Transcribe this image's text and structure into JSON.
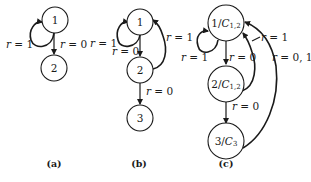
{
  "diagrams": {
    "a": {
      "caption": "(a)",
      "nodes": [
        {
          "id": "1",
          "label": "1"
        },
        {
          "id": "2",
          "label": "2"
        }
      ],
      "edges": [
        {
          "from": "1",
          "to": "1",
          "label": "r = 1",
          "var": "r",
          "eq": " = 1"
        },
        {
          "from": "1",
          "to": "2",
          "label": "r = 0",
          "var": "r",
          "eq": " = 0"
        }
      ]
    },
    "b": {
      "caption": "(b)",
      "nodes": [
        {
          "id": "1",
          "label": "1"
        },
        {
          "id": "2",
          "label": "2"
        },
        {
          "id": "3",
          "label": "3"
        }
      ],
      "edges": [
        {
          "from": "1",
          "to": "1",
          "label": "r = 1",
          "var": "r",
          "eq": " = 1"
        },
        {
          "from": "1",
          "to": "2",
          "label": "r = 0",
          "var": "r",
          "eq": " = 0"
        },
        {
          "from": "2",
          "to": "1",
          "label": "r = 1",
          "var": "r",
          "eq": " = 1"
        },
        {
          "from": "2",
          "to": "3",
          "label": "r = 0",
          "var": "r",
          "eq": " = 0"
        }
      ]
    },
    "c": {
      "caption": "(c)",
      "nodes": [
        {
          "id": "1",
          "label": "1/C1,2",
          "num": "1/",
          "sym": "C",
          "sub": "1,2"
        },
        {
          "id": "2",
          "label": "2/C1,2",
          "num": "2/",
          "sym": "C",
          "sub": "1,2"
        },
        {
          "id": "3",
          "label": "3/C3",
          "num": "3/",
          "sym": "C",
          "sub": "3"
        }
      ],
      "edges": [
        {
          "from": "1",
          "to": "1",
          "label": "r = 1",
          "var": "r",
          "eq": " = 1"
        },
        {
          "from": "1",
          "to": "2",
          "label": "r = 0",
          "var": "r",
          "eq": " = 0"
        },
        {
          "from": "2",
          "to": "1",
          "label": "r = 1",
          "var": "r",
          "eq": " = 1"
        },
        {
          "from": "2",
          "to": "3",
          "label": "r = 0",
          "var": "r",
          "eq": " = 0"
        },
        {
          "from": "3",
          "to": "1",
          "label": "r = 0, 1",
          "var": "r",
          "eq": " = 0, 1"
        }
      ]
    }
  }
}
